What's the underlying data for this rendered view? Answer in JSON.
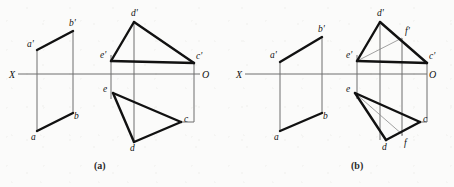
{
  "figure": {
    "caption_a": "(a)",
    "caption_b": "(b)",
    "stroke_color": "#111111",
    "axis_color": "#6e6e6e",
    "thin_color": "#8a8a8a",
    "background": "#fbfbfa",
    "heavy_width": 2.4,
    "light_width": 0.8,
    "axis_width": 1.0
  },
  "panel_a": {
    "name": "(a)",
    "axis": {
      "label_x": "X",
      "label_o": "O",
      "x1": 18,
      "y1": 74,
      "x2": 200,
      "y2": 74,
      "label_x_pos": {
        "x": 9,
        "y": 78
      },
      "label_o_pos": {
        "x": 202,
        "y": 78
      }
    },
    "parallelogram": {
      "name": "plane-abba-prime",
      "points": [
        {
          "id": "a'",
          "x": 37,
          "y": 50,
          "lx": 27,
          "ly": 47
        },
        {
          "id": "b'",
          "x": 73,
          "y": 31,
          "lx": 69,
          "ly": 26
        },
        {
          "id": "b",
          "x": 73,
          "y": 113,
          "lx": 74,
          "ly": 119
        },
        {
          "id": "a",
          "x": 37,
          "y": 131,
          "lx": 31,
          "ly": 140
        }
      ],
      "heavy_edges": [
        [
          "a'",
          "b'"
        ],
        [
          "b",
          "a"
        ]
      ],
      "light_edges": [
        [
          "a'",
          "a"
        ],
        [
          "b'",
          "b"
        ]
      ]
    },
    "upper_triangle": {
      "name": "front-view-triangle",
      "points": [
        {
          "id": "d'",
          "x": 134,
          "y": 22,
          "lx": 131,
          "ly": 16
        },
        {
          "id": "e'",
          "x": 111,
          "y": 61,
          "lx": 100,
          "ly": 58
        },
        {
          "id": "c'",
          "x": 194,
          "y": 63,
          "lx": 196,
          "ly": 59
        }
      ],
      "edges": [
        [
          "d'",
          "e'"
        ],
        [
          "d'",
          "c'"
        ],
        [
          "e'",
          "c'"
        ]
      ]
    },
    "lower_triangle": {
      "name": "top-view-triangle",
      "points": [
        {
          "id": "e",
          "x": 113,
          "y": 93,
          "lx": 103,
          "ly": 92
        },
        {
          "id": "d",
          "x": 134,
          "y": 142,
          "lx": 130,
          "ly": 151
        },
        {
          "id": "c",
          "x": 181,
          "y": 122,
          "lx": 184,
          "ly": 122
        }
      ],
      "edges": [
        [
          "e",
          "d"
        ],
        [
          "d",
          "c"
        ],
        [
          "c",
          "e"
        ]
      ]
    },
    "projectors": [
      {
        "name": "projector-e",
        "x1": 111,
        "y1": 55,
        "x2": 111,
        "y2": 99
      },
      {
        "name": "projector-d",
        "x1": 134,
        "y1": 22,
        "x2": 134,
        "y2": 142
      },
      {
        "name": "projector-c",
        "x1": 194,
        "y1": 63,
        "x2": 194,
        "y2": 122
      }
    ],
    "connector_c": {
      "name": "connector-c-to-cprime",
      "x1": 181,
      "y1": 122,
      "x2": 194,
      "y2": 122
    }
  },
  "panel_b": {
    "name": "(b)",
    "axis": {
      "label_x": "X",
      "label_o": "O",
      "x1": 245,
      "y1": 74,
      "x2": 427,
      "y2": 74,
      "label_x_pos": {
        "x": 236,
        "y": 78
      },
      "label_o_pos": {
        "x": 429,
        "y": 78
      }
    },
    "parallelogram": {
      "name": "plane-abba-prime",
      "points": [
        {
          "id": "a'",
          "x": 280,
          "y": 62,
          "lx": 270,
          "ly": 58
        },
        {
          "id": "b'",
          "x": 322,
          "y": 37,
          "lx": 318,
          "ly": 32
        },
        {
          "id": "b",
          "x": 322,
          "y": 113,
          "lx": 323,
          "ly": 119
        },
        {
          "id": "a",
          "x": 280,
          "y": 131,
          "lx": 274,
          "ly": 140
        }
      ],
      "heavy_edges": [
        [
          "a'",
          "b'"
        ],
        [
          "b",
          "a"
        ]
      ],
      "light_edges": [
        [
          "a'",
          "a"
        ],
        [
          "b'",
          "b"
        ]
      ]
    },
    "upper_triangle": {
      "name": "front-view-triangle",
      "points": [
        {
          "id": "d'",
          "x": 380,
          "y": 22,
          "lx": 377,
          "ly": 16
        },
        {
          "id": "e'",
          "x": 357,
          "y": 61,
          "lx": 346,
          "ly": 58
        },
        {
          "id": "c'",
          "x": 427,
          "y": 63,
          "lx": 429,
          "ly": 59
        },
        {
          "id": "f'",
          "x": 402,
          "y": 38,
          "lx": 405,
          "ly": 34
        }
      ],
      "edges": [
        [
          "d'",
          "e'"
        ],
        [
          "d'",
          "c'"
        ],
        [
          "e'",
          "c'"
        ]
      ],
      "auxiliary_edges": [
        [
          "e'",
          "f'"
        ]
      ]
    },
    "lower_triangle": {
      "name": "top-view-triangle",
      "points": [
        {
          "id": "e",
          "x": 355,
          "y": 93,
          "lx": 346,
          "ly": 92
        },
        {
          "id": "d",
          "x": 386,
          "y": 140,
          "lx": 382,
          "ly": 150
        },
        {
          "id": "c",
          "x": 420,
          "y": 122,
          "lx": 423,
          "ly": 122
        },
        {
          "id": "f",
          "x": 403,
          "y": 135,
          "lx": 404,
          "ly": 146
        }
      ],
      "edges": [
        [
          "e",
          "d"
        ],
        [
          "d",
          "c"
        ],
        [
          "c",
          "e"
        ]
      ],
      "auxiliary_edges": [
        [
          "e",
          "f"
        ]
      ]
    },
    "projectors": [
      {
        "name": "projector-e",
        "x1": 357,
        "y1": 55,
        "x2": 357,
        "y2": 99
      },
      {
        "name": "projector-d",
        "x1": 380,
        "y1": 22,
        "x2": 380,
        "y2": 140
      },
      {
        "name": "projector-f",
        "x1": 402,
        "y1": 38,
        "x2": 402,
        "y2": 136
      },
      {
        "name": "projector-c",
        "x1": 427,
        "y1": 63,
        "x2": 427,
        "y2": 122
      }
    ],
    "connector_c": {
      "name": "connector-c-to-cprime",
      "x1": 420,
      "y1": 122,
      "x2": 427,
      "y2": 122
    }
  }
}
